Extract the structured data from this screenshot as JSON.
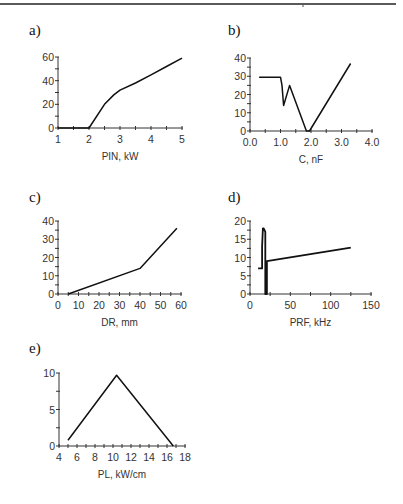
{
  "page": {
    "panels": [
      {
        "id": "a",
        "label": "a)"
      },
      {
        "id": "b",
        "label": "b)"
      },
      {
        "id": "c",
        "label": "c)"
      },
      {
        "id": "d",
        "label": "d)"
      },
      {
        "id": "e",
        "label": "e)"
      }
    ]
  },
  "chart_data": [
    {
      "panel": "a)",
      "type": "line",
      "title": "",
      "xlabel": "PIN, kW",
      "ylabel": "",
      "xlim": [
        1,
        5
      ],
      "ylim": [
        0,
        60
      ],
      "xticks": [
        1,
        2,
        3,
        4,
        5
      ],
      "yticks": [
        0,
        20,
        40,
        60
      ],
      "grid": false,
      "x": [
        1.0,
        2.0,
        2.5,
        2.8,
        3.0,
        3.5,
        4.0,
        4.5,
        5.0
      ],
      "y": [
        0,
        0,
        20,
        28,
        32,
        38,
        45,
        52,
        59
      ]
    },
    {
      "panel": "b)",
      "type": "line",
      "title": "",
      "xlabel": "C, nF",
      "ylabel": "",
      "xlim": [
        0.0,
        4.0
      ],
      "ylim": [
        0,
        40
      ],
      "xticks": [
        "0.0",
        "1.0",
        "2.0",
        "3.0",
        "4.0"
      ],
      "yticks": [
        0,
        10,
        20,
        30,
        40
      ],
      "grid": false,
      "x": [
        0.3,
        1.0,
        1.05,
        1.1,
        1.3,
        1.85,
        1.95,
        3.3
      ],
      "y": [
        29.5,
        29.5,
        25,
        14,
        25,
        0,
        0,
        37
      ]
    },
    {
      "panel": "c)",
      "type": "line",
      "title": "",
      "xlabel": "DR, mm",
      "ylabel": "",
      "xlim": [
        0,
        60
      ],
      "ylim": [
        0,
        40
      ],
      "xticks": [
        0,
        10,
        20,
        30,
        40,
        50,
        60
      ],
      "yticks": [
        0,
        10,
        20,
        30,
        40
      ],
      "grid": false,
      "x": [
        5,
        40,
        58
      ],
      "y": [
        0,
        14,
        36
      ]
    },
    {
      "panel": "d)",
      "type": "line",
      "title": "",
      "xlabel": "PRF, kHz",
      "ylabel": "",
      "xlim": [
        0,
        150
      ],
      "ylim": [
        0,
        20
      ],
      "xticks": [
        0,
        50,
        100,
        150
      ],
      "yticks": [
        0,
        5,
        10,
        15,
        20
      ],
      "grid": false,
      "x": [
        10,
        15,
        15,
        16,
        17,
        19,
        19,
        20,
        20,
        21,
        21,
        125
      ],
      "y": [
        7,
        7,
        13,
        18,
        18,
        17,
        0,
        0,
        9,
        0,
        9,
        12.7
      ]
    },
    {
      "panel": "e)",
      "type": "line",
      "title": "",
      "xlabel": "PL, kW/cm",
      "ylabel": "",
      "xlim": [
        4,
        18
      ],
      "ylim": [
        0,
        10
      ],
      "xticks": [
        4,
        6,
        8,
        10,
        12,
        14,
        16,
        18
      ],
      "yticks": [
        0,
        5,
        10
      ],
      "grid": false,
      "x": [
        5,
        10.4,
        16.7
      ],
      "y": [
        0.8,
        9.7,
        0
      ]
    }
  ],
  "layout": {
    "plots": [
      {
        "px": [
          58,
          182
        ],
        "py": [
          128,
          57
        ],
        "minorX": 8,
        "minorY": 6
      },
      {
        "px": [
          250,
          372
        ],
        "py": [
          131,
          58
        ],
        "minorX": 8,
        "minorY": 8
      },
      {
        "px": [
          58,
          181
        ],
        "py": [
          294,
          221
        ],
        "minorX": 12,
        "minorY": 8
      },
      {
        "px": [
          250,
          371
        ],
        "py": [
          294,
          221
        ],
        "minorX": 6,
        "minorY": 8
      },
      {
        "px": [
          59,
          185
        ],
        "py": [
          446,
          373
        ],
        "minorX": 14,
        "minorY": 4
      }
    ],
    "labelPos": [
      [
        29,
        22
      ],
      [
        228,
        22
      ],
      [
        29,
        189
      ],
      [
        228,
        189
      ],
      [
        29,
        340
      ]
    ],
    "line_color": "#111111",
    "axis_color": "#333333"
  }
}
